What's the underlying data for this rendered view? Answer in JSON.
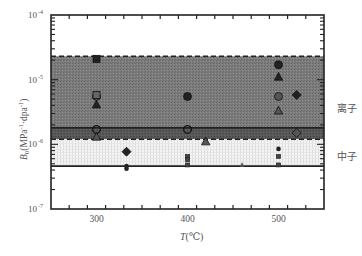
{
  "chart_data": {
    "type": "scatter",
    "title": "",
    "xlabel": "T(℃)",
    "ylabel": "B₀(MPa⁻¹·dpa⁻¹)",
    "xlim": [
      250,
      550
    ],
    "ylim": [
      1e-07,
      0.0001
    ],
    "yscale": "log",
    "x_ticks": [
      300,
      400,
      500
    ],
    "x_tick_labels": [
      "300",
      "400",
      "500"
    ],
    "y_ticks": [
      1e-07,
      1e-06,
      1e-05,
      0.0001
    ],
    "y_tick_labels": [
      {
        "base": "10",
        "exp": "-7"
      },
      {
        "base": "10",
        "exp": "-6"
      },
      {
        "base": "10",
        "exp": "-5"
      },
      {
        "base": "10",
        "exp": "-4"
      }
    ],
    "grid": false,
    "regions": [
      {
        "name": "离子",
        "label": "离子",
        "y_low": 1.8e-06,
        "y_high": 2.3e-05,
        "fill": "#7a7a7a",
        "top_line": "dashed",
        "bottom_line": "solid"
      },
      {
        "name": "overlap",
        "y_low": 1.2e-06,
        "y_high": 1.8e-06,
        "fill": "#555555",
        "bottom_line": "dashed"
      },
      {
        "name": "中子",
        "label": "中子",
        "y_low": 4.6e-07,
        "y_high": 1.2e-06,
        "fill": "#ececec",
        "bottom_line": "solid"
      }
    ],
    "series": [
      {
        "name": "filled-square",
        "marker": "square",
        "fill": "#222222",
        "points": [
          [
            300,
            2.1e-05
          ]
        ]
      },
      {
        "name": "filled-circle",
        "marker": "circle",
        "fill": "#222222",
        "points": [
          [
            400,
            5.5e-06
          ],
          [
            500,
            1.7e-05
          ]
        ]
      },
      {
        "name": "gray-circle",
        "marker": "circle",
        "fill": "#555555",
        "points": [
          [
            300,
            5.5e-06
          ],
          [
            500,
            5.5e-06
          ]
        ]
      },
      {
        "name": "open-circle",
        "marker": "circle-open",
        "fill": "none",
        "points": [
          [
            300,
            1.7e-06
          ],
          [
            400,
            1.7e-06
          ]
        ]
      },
      {
        "name": "gray-square",
        "marker": "square",
        "fill": "#666666",
        "points": [
          [
            300,
            5.8e-06
          ]
        ]
      },
      {
        "name": "filled-triangle",
        "marker": "triangle",
        "fill": "#222222",
        "points": [
          [
            300,
            4.1e-06
          ],
          [
            500,
            1.1e-05
          ]
        ]
      },
      {
        "name": "gray-triangle",
        "marker": "triangle",
        "fill": "#555555",
        "points": [
          [
            500,
            3.3e-06
          ],
          [
            300,
            1.3e-06
          ],
          [
            420,
            1.1e-06
          ]
        ]
      },
      {
        "name": "filled-diamond",
        "marker": "diamond",
        "fill": "#222222",
        "points": [
          [
            520,
            5.8e-06
          ],
          [
            333,
            7.7e-07
          ]
        ]
      },
      {
        "name": "gray-diamond",
        "marker": "diamond",
        "fill": "#555555",
        "points": [
          [
            520,
            1.5e-06
          ]
        ]
      },
      {
        "name": "small-circle",
        "marker": "circle-small",
        "fill": "#222222",
        "points": [
          [
            333,
            4.6e-07
          ],
          [
            333,
            4.2e-07
          ],
          [
            500,
            8.5e-07
          ]
        ]
      },
      {
        "name": "small-square",
        "marker": "square-small",
        "fill": "#444444",
        "points": [
          [
            400,
            6.5e-07
          ],
          [
            400,
            5.8e-07
          ],
          [
            400,
            4.8e-07
          ],
          [
            500,
            6.5e-07
          ],
          [
            500,
            4.8e-07
          ]
        ]
      },
      {
        "name": "small-triangle",
        "marker": "triangle-small",
        "fill": "#555555",
        "points": [
          [
            460,
            4.8e-07
          ]
        ]
      }
    ],
    "annotations": [
      {
        "text": "离子",
        "x_px": 338,
        "y_px": 108
      },
      {
        "text": "中子",
        "x_px": 338,
        "y_px": 156
      }
    ]
  },
  "labels": {
    "region_ion": "离子",
    "region_neutron": "中子",
    "xlabel_T": "T",
    "xlabel_unit": "(℃)",
    "ylabel_B": "B",
    "ylabel_sub": "0",
    "ylabel_rest": "(MPa",
    "ylabel_exp1": "-1",
    "ylabel_mid": "·dpa",
    "ylabel_exp2": "-1",
    "ylabel_close": ")"
  }
}
